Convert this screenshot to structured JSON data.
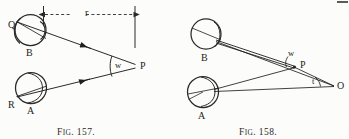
{
  "page": {
    "width": 349,
    "height": 139,
    "background_color": "#fcfcfb",
    "ink_color": "#2b2a28"
  },
  "figures": [
    {
      "id": "fig-157",
      "caption_prefix": "F",
      "caption_smallcaps": "IG",
      "caption_number": ". 157.",
      "caption_full": "Fig. 157.",
      "dimension_label": "r",
      "labels": [
        {
          "name": "label-Q",
          "text": "Q"
        },
        {
          "name": "label-B",
          "text": "B"
        },
        {
          "name": "label-R",
          "text": "R"
        },
        {
          "name": "label-A",
          "text": "A"
        },
        {
          "name": "label-w",
          "text": "w"
        },
        {
          "name": "label-P",
          "text": "P"
        }
      ]
    },
    {
      "id": "fig-158",
      "caption_prefix": "F",
      "caption_smallcaps": "IG",
      "caption_number": ". 158.",
      "caption_full": "Fig. 158.",
      "labels": [
        {
          "name": "label-B",
          "text": "B"
        },
        {
          "name": "label-A",
          "text": "A"
        },
        {
          "name": "label-w",
          "text": "w"
        },
        {
          "name": "label-P",
          "text": "P"
        },
        {
          "name": "label-t",
          "text": "t"
        },
        {
          "name": "label-O",
          "text": "O"
        }
      ]
    }
  ],
  "fig157": {
    "label_Q": "Q",
    "label_B": "B",
    "label_R": "R",
    "label_A": "A",
    "label_w": "w",
    "label_P": "P",
    "label_r": "r",
    "caption_f": "F",
    "caption_ig": "IG",
    "caption_num": ". 157."
  },
  "fig158": {
    "label_B": "B",
    "label_A": "A",
    "label_w": "w",
    "label_P": "P",
    "label_t": "t",
    "label_O": "O",
    "caption_f": "F",
    "caption_ig": "IG",
    "caption_num": ". 158."
  }
}
